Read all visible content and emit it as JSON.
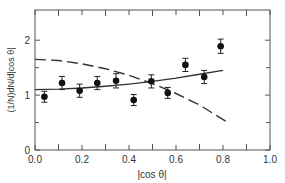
{
  "chart_data": {
    "type": "scatter",
    "title": "",
    "xlabel": "|cos θ|",
    "ylabel": "(1/N)dN/d|cos θ|",
    "xlim": [
      0.0,
      1.0
    ],
    "ylim": [
      0,
      2.55
    ],
    "xticks": [
      0.0,
      0.2,
      0.4,
      0.6,
      0.8,
      1.0
    ],
    "xtick_labels": [
      "0.0",
      "0.2",
      "0.4",
      "0.6",
      "0.8",
      "1.0"
    ],
    "xminor_ticks": [
      0.1,
      0.3,
      0.5,
      0.7,
      0.9
    ],
    "yticks": [
      0,
      1,
      2
    ],
    "ytick_labels": [
      "0",
      "1",
      "2"
    ],
    "yminor_ticks": [
      0.5,
      1.5
    ],
    "grid": false,
    "legend": null,
    "series": [
      {
        "name": "data",
        "style": "points-with-error-bars",
        "x": [
          0.04,
          0.115,
          0.19,
          0.265,
          0.345,
          0.42,
          0.495,
          0.565,
          0.64,
          0.72,
          0.79
        ],
        "y": [
          0.97,
          1.22,
          1.08,
          1.22,
          1.26,
          0.91,
          1.25,
          1.04,
          1.55,
          1.33,
          1.89
        ],
        "yerr": [
          0.1,
          0.12,
          0.12,
          0.12,
          0.13,
          0.1,
          0.12,
          0.1,
          0.12,
          0.12,
          0.13
        ]
      },
      {
        "name": "solid-fit",
        "style": "solid-line",
        "x": [
          0.0,
          0.1,
          0.2,
          0.3,
          0.4,
          0.5,
          0.6,
          0.7,
          0.8
        ],
        "y": [
          1.1,
          1.11,
          1.13,
          1.16,
          1.2,
          1.25,
          1.31,
          1.38,
          1.45
        ]
      },
      {
        "name": "dashed-prediction",
        "style": "dashed-line",
        "x": [
          0.0,
          0.1,
          0.2,
          0.3,
          0.4,
          0.5,
          0.6,
          0.7,
          0.82
        ],
        "y": [
          1.65,
          1.63,
          1.57,
          1.48,
          1.36,
          1.21,
          1.03,
          0.82,
          0.5
        ]
      }
    ]
  }
}
